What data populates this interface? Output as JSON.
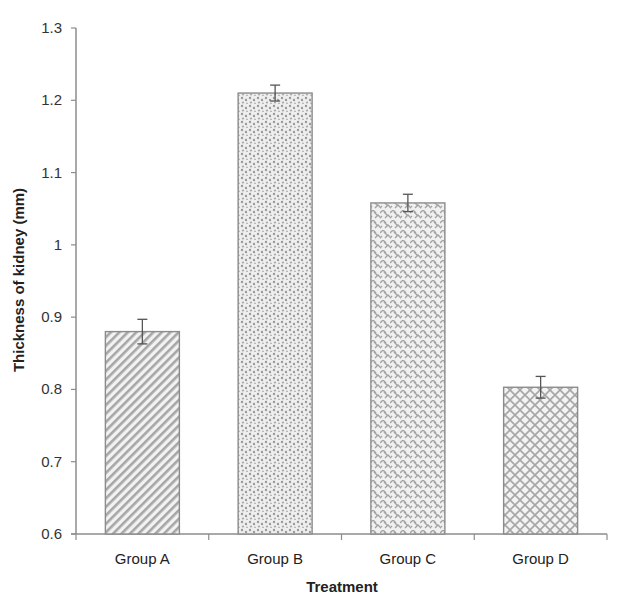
{
  "chart_data": {
    "type": "bar",
    "title": "",
    "xlabel": "Treatment",
    "ylabel": "Thickness of kidney (mm)",
    "categories": [
      "Group A",
      "Group B",
      "Group C",
      "Group D"
    ],
    "values": [
      0.88,
      1.21,
      1.058,
      0.803
    ],
    "error": [
      0.017,
      0.011,
      0.012,
      0.015
    ],
    "patterns": [
      "diagonal-hatch",
      "stipple-dots",
      "zigzag-weave",
      "diamond-lattice"
    ],
    "ylim": [
      0.6,
      1.3
    ],
    "yticks": [
      "0.6",
      "0.7",
      "0.8",
      "0.9",
      "1",
      "1.1",
      "1.2",
      "1.3"
    ],
    "grid": false,
    "legend": "none",
    "colors": {
      "bar_fill": "#d9d9d9",
      "bar_pattern": "#9a9a9a",
      "bar_border": "#8c8c8c",
      "axis": "#8c8c8c",
      "error_bar": "#555555"
    }
  }
}
